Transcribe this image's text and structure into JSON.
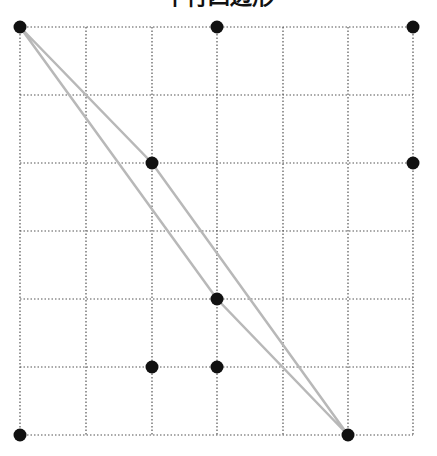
{
  "title": "平行四边形",
  "grid": {
    "cols": 6,
    "rows": 6,
    "x": [
      20,
      86,
      152,
      217,
      283,
      348,
      413
    ],
    "y": [
      27,
      95,
      163,
      231,
      299,
      367,
      435
    ],
    "line_color": "#555555"
  },
  "dots": [
    {
      "col": 0,
      "row": 0
    },
    {
      "col": 3,
      "row": 0
    },
    {
      "col": 6,
      "row": 0
    },
    {
      "col": 2,
      "row": 2
    },
    {
      "col": 6,
      "row": 2
    },
    {
      "col": 3,
      "row": 4
    },
    {
      "col": 2,
      "row": 5
    },
    {
      "col": 3,
      "row": 5
    },
    {
      "col": 0,
      "row": 6
    },
    {
      "col": 5,
      "row": 6
    }
  ],
  "dot_color": "#111111",
  "parallelogram": {
    "vertices": [
      {
        "col": 0,
        "row": 0
      },
      {
        "col": 2,
        "row": 2
      },
      {
        "col": 5,
        "row": 6
      },
      {
        "col": 3,
        "row": 4
      }
    ],
    "stroke": "#b8b8b8"
  }
}
